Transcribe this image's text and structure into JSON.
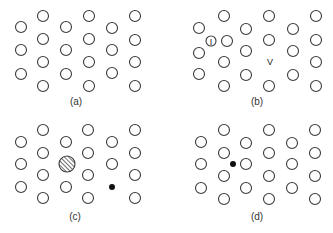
{
  "figure": {
    "stroke_color": "#3a3a3a",
    "fill_dark": "#111111",
    "atom_radius": 5.5,
    "panels": [
      {
        "id": "a",
        "label": "(a)",
        "label_pos": [
          76,
          105
        ],
        "title": "perfect lattice",
        "atoms": [
          [
            21,
            27
          ],
          [
            21,
            50
          ],
          [
            21,
            74
          ],
          [
            43,
            16
          ],
          [
            43,
            39
          ],
          [
            43,
            62
          ],
          [
            43,
            86
          ],
          [
            66,
            27
          ],
          [
            66,
            50
          ],
          [
            66,
            74
          ],
          [
            89,
            16
          ],
          [
            89,
            39
          ],
          [
            89,
            62
          ],
          [
            89,
            86
          ],
          [
            112,
            28
          ],
          [
            112,
            50
          ],
          [
            112,
            73
          ],
          [
            135,
            16
          ],
          [
            135,
            40
          ],
          [
            135,
            62
          ],
          [
            135,
            86
          ]
        ],
        "defects": []
      },
      {
        "id": "b",
        "label": "(b)",
        "label_pos": [
          257,
          105
        ],
        "title": "interstitial and vacancy",
        "atoms": [
          [
            199,
            28
          ],
          [
            199,
            53
          ],
          [
            199,
            74
          ],
          [
            224,
            16
          ],
          [
            227,
            41
          ],
          [
            224,
            62
          ],
          [
            224,
            86
          ],
          [
            246,
            29
          ],
          [
            246,
            51
          ],
          [
            246,
            75
          ],
          [
            269,
            16
          ],
          [
            269,
            40
          ],
          [
            269,
            86
          ],
          [
            293,
            29
          ],
          [
            293,
            51
          ],
          [
            293,
            75
          ],
          [
            316,
            16
          ],
          [
            316,
            40
          ],
          [
            316,
            62
          ],
          [
            316,
            86
          ]
        ],
        "defects": [
          {
            "type": "interstitial",
            "symbol": "I",
            "pos": [
              211,
              41
            ],
            "r": 5
          },
          {
            "type": "vacancy",
            "symbol": "V",
            "pos": [
              270,
              62
            ]
          }
        ]
      },
      {
        "id": "c",
        "label": "(c)",
        "label_pos": [
          75,
          220
        ],
        "title": "substitutional impurities",
        "atoms": [
          [
            21,
            142
          ],
          [
            21,
            164
          ],
          [
            21,
            187
          ],
          [
            43,
            130
          ],
          [
            43,
            153
          ],
          [
            43,
            175
          ],
          [
            43,
            198
          ],
          [
            66,
            142
          ],
          [
            66,
            187
          ],
          [
            88,
            130
          ],
          [
            88,
            153
          ],
          [
            88,
            175
          ],
          [
            88,
            198
          ],
          [
            112,
            142
          ],
          [
            112,
            164
          ],
          [
            135,
            130
          ],
          [
            135,
            153
          ],
          [
            135,
            175
          ],
          [
            135,
            198
          ]
        ],
        "defects": [
          {
            "type": "large-substitutional",
            "pos": [
              67,
              164
            ],
            "r": 8
          },
          {
            "type": "small-substitutional",
            "pos": [
              112,
              187
            ],
            "r": 3
          }
        ]
      },
      {
        "id": "d",
        "label": "(d)",
        "label_pos": [
          257,
          220
        ],
        "title": "interstitial impurity",
        "atoms": [
          [
            201,
            142
          ],
          [
            201,
            164
          ],
          [
            201,
            188
          ],
          [
            224,
            130
          ],
          [
            224,
            153
          ],
          [
            224,
            176
          ],
          [
            224,
            199
          ],
          [
            246,
            143
          ],
          [
            246,
            164
          ],
          [
            246,
            188
          ],
          [
            269,
            130
          ],
          [
            269,
            153
          ],
          [
            269,
            176
          ],
          [
            269,
            199
          ],
          [
            292,
            143
          ],
          [
            292,
            164
          ],
          [
            292,
            188
          ],
          [
            315,
            130
          ],
          [
            315,
            153
          ],
          [
            315,
            176
          ],
          [
            315,
            199
          ]
        ],
        "defects": [
          {
            "type": "interstitial-impurity",
            "pos": [
              233,
              164
            ],
            "r": 3
          }
        ]
      }
    ]
  }
}
